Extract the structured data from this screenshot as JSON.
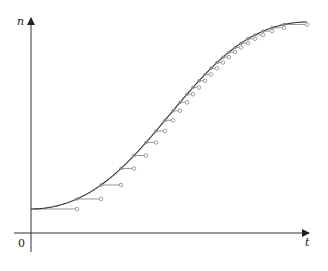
{
  "chart_data": {
    "type": "line",
    "title": "",
    "xlabel": "t",
    "ylabel": "n",
    "origin_label": "0",
    "grid": false,
    "legend": null,
    "axis_pixels": {
      "origin_x": 31,
      "origin_y": 233,
      "x_end": 310,
      "y_end": 16
    },
    "curve": {
      "start": [
        31,
        209
      ],
      "end": [
        307,
        22
      ],
      "shape": "logistic"
    },
    "step_x": [
      31,
      77,
      101,
      121,
      134,
      146,
      156,
      165,
      173,
      180,
      187,
      193,
      199,
      205,
      211,
      217,
      223,
      229,
      235,
      241,
      248,
      255,
      263,
      272,
      284,
      307
    ],
    "colors": {
      "curve": "#333333",
      "steps": "#8a8a8a",
      "axis": "#333333"
    }
  }
}
